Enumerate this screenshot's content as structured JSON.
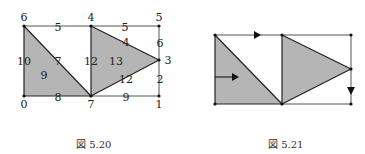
{
  "figures": [
    {
      "caption": "図 5.20",
      "vertex_labels": [
        "0",
        "1",
        "3",
        "4",
        "5",
        "6",
        "7"
      ],
      "vertices": {
        "0": {
          "x": 24,
          "y": 96,
          "label": "0"
        },
        "1": {
          "x": 159,
          "y": 96,
          "label": "1"
        },
        "3": {
          "x": 159,
          "y": 60,
          "label": "3"
        },
        "4": {
          "x": 91,
          "y": 26,
          "label": "4"
        },
        "5": {
          "x": 159,
          "y": 26,
          "label": "5"
        },
        "6": {
          "x": 24,
          "y": 26,
          "label": "6"
        },
        "7": {
          "x": 91,
          "y": 96,
          "label": "7"
        }
      },
      "edge_labels": {
        "e6_4": "5",
        "e4_5": "5",
        "e4_3": "4",
        "e5_3": "6",
        "e3_1": "2",
        "e6_0": "10",
        "e6_7": "7",
        "e4_7": "12",
        "e7_3": "12",
        "e0_7": "8",
        "e7_1": "9"
      },
      "face_labels": {
        "left_triangle": "9",
        "right_triangle": "13"
      }
    },
    {
      "caption": "図 5.21"
    }
  ],
  "colors": {
    "fill": "#b5b5b5",
    "stroke": "#222222",
    "thin_stroke": "#555555"
  }
}
